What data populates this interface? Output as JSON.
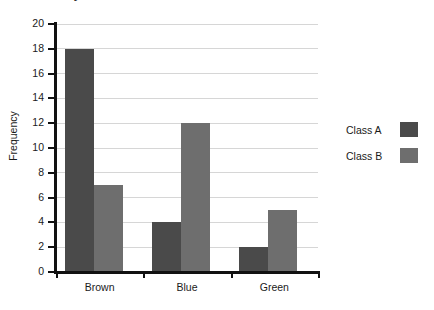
{
  "chart_data": {
    "type": "bar",
    "title": "Eye colour for Class A and Class B",
    "xlabel": "",
    "ylabel": "Frequency",
    "categories": [
      "Brown",
      "Blue",
      "Green"
    ],
    "series": [
      {
        "name": "Class A",
        "values": [
          18,
          4,
          2
        ],
        "color": "#4a4a4a"
      },
      {
        "name": "Class B",
        "values": [
          7,
          12,
          5
        ],
        "color": "#6e6e6e"
      }
    ],
    "ylim": [
      0,
      20
    ],
    "ytick_step": 2,
    "ytick_labels": [
      "0",
      "2",
      "4",
      "6",
      "8",
      "10",
      "12",
      "14",
      "16",
      "18",
      "20"
    ],
    "grid": true,
    "grid_color": "#d6d6d6",
    "legend_position": "right",
    "axis_color": "#111111"
  },
  "legend": {
    "entries": [
      {
        "label": "Class A"
      },
      {
        "label": "Class B"
      }
    ]
  }
}
